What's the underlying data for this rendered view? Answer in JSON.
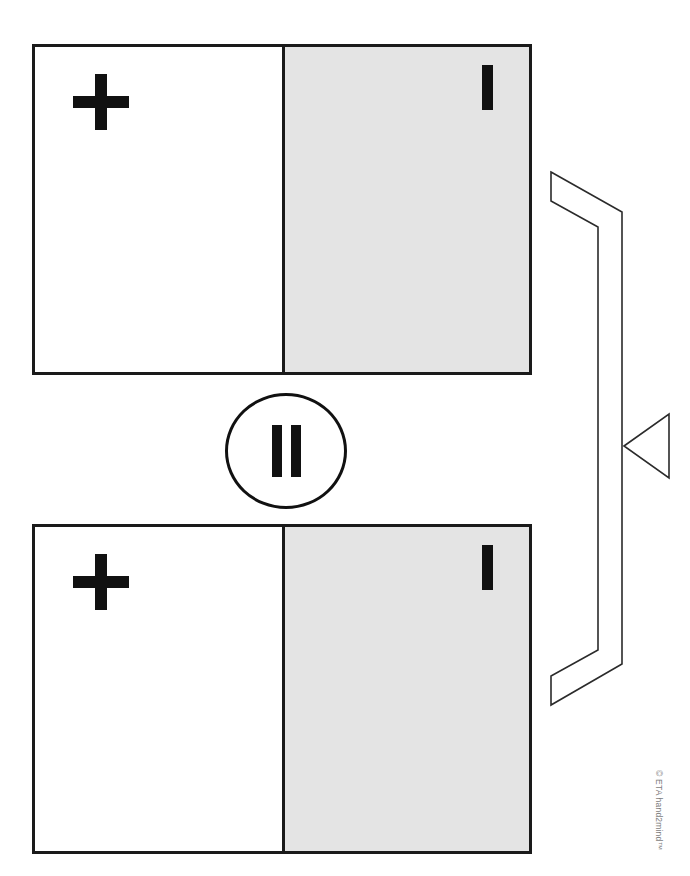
{
  "page": {
    "background_color": "#ffffff",
    "ink_color": "#111111",
    "shaded_color": "#e4e4e4",
    "width": 690,
    "height": 876
  },
  "cards": [
    {
      "id": "card-top",
      "left_pane": {
        "fill": "white",
        "glyph_name": "plus-sign",
        "glyph_text": "+"
      },
      "right_pane": {
        "fill": "shaded-gray",
        "glyph_name": "tally-one",
        "glyph_text": "I"
      }
    },
    {
      "id": "card-bottom",
      "left_pane": {
        "fill": "white",
        "glyph_name": "plus-sign",
        "glyph_text": "+"
      },
      "right_pane": {
        "fill": "shaded-gray",
        "glyph_name": "tally-one",
        "glyph_text": "I"
      }
    }
  ],
  "equals_badge": {
    "name": "equals-badge",
    "glyph_text": "=",
    "orientation": "rotated-vertical",
    "bar_count": 2,
    "shape": "circle"
  },
  "bracket": {
    "name": "grouping-bracket",
    "direction": "points-left",
    "arrowhead": "triangle",
    "stroke_color": "#2b2b2b",
    "fill": "none"
  },
  "copyright": {
    "text": "© ETA hand2mind™",
    "color": "#7d7d7d",
    "orientation": "rotated-90"
  }
}
